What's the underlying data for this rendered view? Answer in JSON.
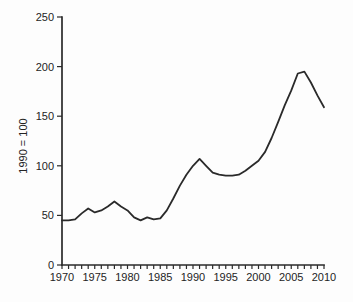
{
  "chart_data": {
    "type": "line",
    "title": "",
    "xlabel": "",
    "ylabel": "1990 = 100",
    "x_range": [
      1970,
      2010
    ],
    "ylim": [
      0,
      250
    ],
    "grid": false,
    "legend": "none",
    "line_color": "#2a2a2a",
    "axis_color": "#2a2a2a",
    "background_color": "#fdfdfd",
    "y_ticks": [
      0,
      50,
      100,
      150,
      200,
      250
    ],
    "x_tick_labels": [
      1970,
      1975,
      1980,
      1985,
      1990,
      1995,
      2000,
      2005,
      2010
    ],
    "x_minor_tick_interval": 1,
    "x": [
      1970,
      1971,
      1972,
      1973,
      1974,
      1975,
      1976,
      1977,
      1978,
      1979,
      1980,
      1981,
      1982,
      1983,
      1984,
      1985,
      1986,
      1987,
      1988,
      1989,
      1990,
      1991,
      1992,
      1993,
      1994,
      1995,
      1996,
      1997,
      1998,
      1999,
      2000,
      2001,
      2002,
      2003,
      2004,
      2005,
      2006,
      2007,
      2008,
      2009,
      2010
    ],
    "values": [
      45,
      45,
      46,
      52,
      57,
      53,
      55,
      59,
      64,
      59,
      55,
      48,
      45,
      48,
      46,
      47,
      55,
      67,
      80,
      91,
      100,
      107,
      100,
      93,
      91,
      90,
      90,
      91,
      95,
      100,
      105,
      114,
      128,
      144,
      161,
      176,
      193,
      195,
      184,
      171,
      159
    ]
  }
}
